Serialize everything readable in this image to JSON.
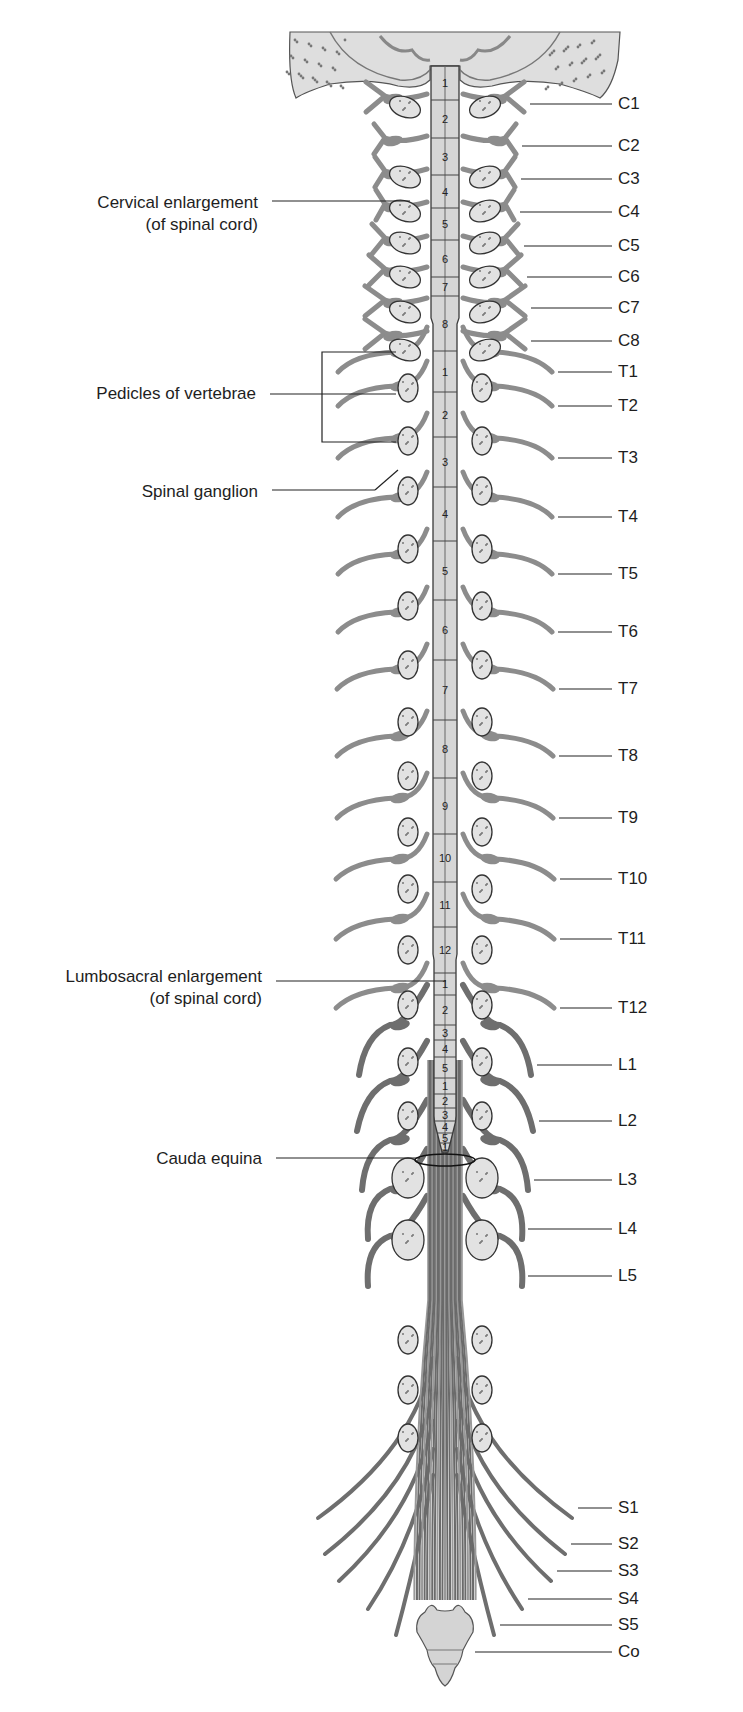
{
  "figure": {
    "colors": {
      "background": "#ffffff",
      "cord_fill": "#d6d6d6",
      "cord_stroke": "#3a3a3a",
      "nerve": "#8c8c8c",
      "nerve_dark": "#6e6e6e",
      "pedicle_fill": "#e2e2e2",
      "bone_fill": "#dedede",
      "leader_line": "#222222",
      "text": "#1e1e1e"
    }
  },
  "left_labels": [
    {
      "id": "cervical-enlargement",
      "lines": [
        "Cervical enlargement",
        "(of spinal cord)"
      ],
      "y": 192,
      "line_y": 201,
      "line_x1": 272,
      "line_x2": 410
    },
    {
      "id": "pedicles-of-vertebrae",
      "lines": [
        "Pedicles of vertebrae"
      ],
      "y": 383,
      "line_y": 394,
      "line_x1": 270,
      "line_x2": 322
    },
    {
      "id": "spinal-ganglion",
      "lines": [
        "Spinal ganglion"
      ],
      "y": 481,
      "line_y": 490,
      "line_x1": 272,
      "line_x2": 375
    },
    {
      "id": "lumbosacral-enlargement",
      "lines": [
        "Lumbosacral enlargement",
        "(of spinal cord)"
      ],
      "y": 966,
      "line_y": 981,
      "line_x1": 276,
      "line_x2": 446
    },
    {
      "id": "cauda-equina",
      "lines": [
        "Cauda equina"
      ],
      "y": 1148,
      "line_y": 1158,
      "line_x1": 276,
      "line_x2": 420
    }
  ],
  "right_labels": [
    {
      "id": "C1",
      "text": "C1",
      "y": 104,
      "line_x1": 530
    },
    {
      "id": "C2",
      "text": "C2",
      "y": 146,
      "line_x1": 522
    },
    {
      "id": "C3",
      "text": "C3",
      "y": 179,
      "line_x1": 521
    },
    {
      "id": "C4",
      "text": "C4",
      "y": 212,
      "line_x1": 520
    },
    {
      "id": "C5",
      "text": "C5",
      "y": 246,
      "line_x1": 524
    },
    {
      "id": "C6",
      "text": "C6",
      "y": 277,
      "line_x1": 527
    },
    {
      "id": "C7",
      "text": "C7",
      "y": 308,
      "line_x1": 531
    },
    {
      "id": "C8",
      "text": "C8",
      "y": 341,
      "line_x1": 531
    },
    {
      "id": "T1",
      "text": "T1",
      "y": 372,
      "line_x1": 558
    },
    {
      "id": "T2",
      "text": "T2",
      "y": 406,
      "line_x1": 558
    },
    {
      "id": "T3",
      "text": "T3",
      "y": 458,
      "line_x1": 558
    },
    {
      "id": "T4",
      "text": "T4",
      "y": 517,
      "line_x1": 558
    },
    {
      "id": "T5",
      "text": "T5",
      "y": 574,
      "line_x1": 558
    },
    {
      "id": "T6",
      "text": "T6",
      "y": 632,
      "line_x1": 558
    },
    {
      "id": "T7",
      "text": "T7",
      "y": 689,
      "line_x1": 559
    },
    {
      "id": "T8",
      "text": "T8",
      "y": 756,
      "line_x1": 559
    },
    {
      "id": "T9",
      "text": "T9",
      "y": 818,
      "line_x1": 559
    },
    {
      "id": "T10",
      "text": "T10",
      "y": 879,
      "line_x1": 560
    },
    {
      "id": "T11",
      "text": "T11",
      "y": 939,
      "line_x1": 560
    },
    {
      "id": "T12",
      "text": "T12",
      "y": 1008,
      "line_x1": 560
    },
    {
      "id": "L1",
      "text": "L1",
      "y": 1065,
      "line_x1": 537
    },
    {
      "id": "L2",
      "text": "L2",
      "y": 1121,
      "line_x1": 539
    },
    {
      "id": "L3",
      "text": "L3",
      "y": 1180,
      "line_x1": 534
    },
    {
      "id": "L4",
      "text": "L4",
      "y": 1229,
      "line_x1": 528
    },
    {
      "id": "L5",
      "text": "L5",
      "y": 1276,
      "line_x1": 528
    },
    {
      "id": "S1",
      "text": "S1",
      "y": 1508,
      "line_x1": 578
    },
    {
      "id": "S2",
      "text": "S2",
      "y": 1544,
      "line_x1": 571
    },
    {
      "id": "S3",
      "text": "S3",
      "y": 1571,
      "line_x1": 557
    },
    {
      "id": "S4",
      "text": "S4",
      "y": 1599,
      "line_x1": 528
    },
    {
      "id": "S5",
      "text": "S5",
      "y": 1625,
      "line_x1": 500
    },
    {
      "id": "Co",
      "text": "Co",
      "y": 1652,
      "line_x1": 475
    }
  ],
  "right_label_line_x2": 612,
  "right_label_text_x": 618,
  "cord_segments": [
    {
      "region": "cervical",
      "num": "1",
      "top": 66,
      "bottom": 100
    },
    {
      "region": "cervical",
      "num": "2",
      "top": 100,
      "bottom": 138
    },
    {
      "region": "cervical",
      "num": "3",
      "top": 138,
      "bottom": 175
    },
    {
      "region": "cervical",
      "num": "4",
      "top": 175,
      "bottom": 208
    },
    {
      "region": "cervical",
      "num": "5",
      "top": 208,
      "bottom": 240
    },
    {
      "region": "cervical",
      "num": "6",
      "top": 240,
      "bottom": 277
    },
    {
      "region": "cervical",
      "num": "7",
      "top": 277,
      "bottom": 296
    },
    {
      "region": "cervical",
      "num": "8",
      "top": 296,
      "bottom": 351
    },
    {
      "region": "thoracic",
      "num": "1",
      "top": 351,
      "bottom": 392
    },
    {
      "region": "thoracic",
      "num": "2",
      "top": 392,
      "bottom": 437
    },
    {
      "region": "thoracic",
      "num": "3",
      "top": 437,
      "bottom": 487
    },
    {
      "region": "thoracic",
      "num": "4",
      "top": 487,
      "bottom": 541
    },
    {
      "region": "thoracic",
      "num": "5",
      "top": 541,
      "bottom": 600
    },
    {
      "region": "thoracic",
      "num": "6",
      "top": 600,
      "bottom": 660
    },
    {
      "region": "thoracic",
      "num": "7",
      "top": 660,
      "bottom": 720
    },
    {
      "region": "thoracic",
      "num": "8",
      "top": 720,
      "bottom": 778
    },
    {
      "region": "thoracic",
      "num": "9",
      "top": 778,
      "bottom": 834
    },
    {
      "region": "thoracic",
      "num": "10",
      "top": 834,
      "bottom": 882
    },
    {
      "region": "thoracic",
      "num": "11",
      "top": 882,
      "bottom": 927
    },
    {
      "region": "thoracic",
      "num": "12",
      "top": 927,
      "bottom": 973
    },
    {
      "region": "lumbar",
      "num": "1",
      "top": 973,
      "bottom": 995
    },
    {
      "region": "lumbar",
      "num": "2",
      "top": 995,
      "bottom": 1025
    },
    {
      "region": "lumbar",
      "num": "3",
      "top": 1025,
      "bottom": 1040
    },
    {
      "region": "lumbar",
      "num": "4",
      "top": 1040,
      "bottom": 1057
    },
    {
      "region": "lumbar",
      "num": "5",
      "top": 1057,
      "bottom": 1078
    },
    {
      "region": "sacral",
      "num": "1",
      "top": 1078,
      "bottom": 1094
    },
    {
      "region": "sacral",
      "num": "2",
      "top": 1094,
      "bottom": 1108
    },
    {
      "region": "sacral",
      "num": "3",
      "top": 1108,
      "bottom": 1121
    },
    {
      "region": "sacral",
      "num": "4",
      "top": 1121,
      "bottom": 1133
    },
    {
      "region": "sacral",
      "num": "5",
      "top": 1133,
      "bottom": 1143
    },
    {
      "region": "coccygeal",
      "num": "1",
      "top": 1143,
      "bottom": 1150
    }
  ]
}
